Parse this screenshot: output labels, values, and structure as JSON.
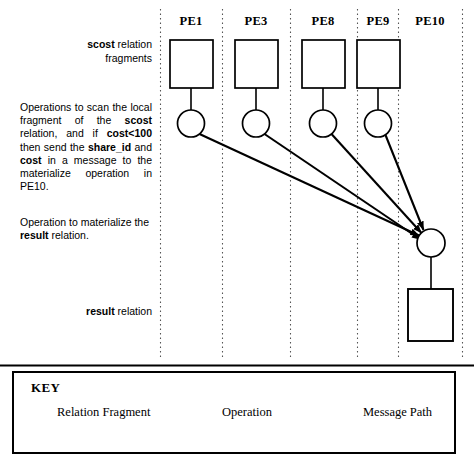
{
  "diagram": {
    "columns": [
      {
        "id": "pe1",
        "label": "PE1",
        "center_x": 191
      },
      {
        "id": "pe3",
        "label": "PE3",
        "center_x": 256
      },
      {
        "id": "pe8",
        "label": "PE8",
        "center_x": 323
      },
      {
        "id": "pe9",
        "label": "PE9",
        "center_x": 378
      },
      {
        "id": "pe10",
        "label": "PE10",
        "center_x": 430
      }
    ],
    "annotations": {
      "scost_fragments": {
        "segments": [
          {
            "text": "scost",
            "bold": true
          },
          {
            "text": " relation",
            "bold": false
          },
          {
            "text": "\nfragments",
            "bold": false
          }
        ]
      },
      "operations_scan": {
        "segments": [
          {
            "text": "Operations to scan the local fragment of the ",
            "bold": false
          },
          {
            "text": "scost",
            "bold": true
          },
          {
            "text": " relation, and if ",
            "bold": false
          },
          {
            "text": "cost<100",
            "bold": true
          },
          {
            "text": " then send the ",
            "bold": false
          },
          {
            "text": "share_id",
            "bold": true
          },
          {
            "text": " and ",
            "bold": false
          },
          {
            "text": "cost",
            "bold": true
          },
          {
            "text": " in a message to the materialize operation in PE10.",
            "bold": false
          }
        ]
      },
      "operation_materialize": {
        "segments": [
          {
            "text": "Operation to materialize the ",
            "bold": false
          },
          {
            "text": "result",
            "bold": true
          },
          {
            "text": " relation.",
            "bold": false
          }
        ]
      },
      "result_relation": {
        "segments": [
          {
            "text": "result",
            "bold": true
          },
          {
            "text": " relation",
            "bold": false
          }
        ]
      }
    },
    "nodes": {
      "fragments": [
        {
          "pe": "PE1",
          "x": 170,
          "y": 40,
          "w": 43,
          "h": 48
        },
        {
          "pe": "PE3",
          "x": 235,
          "y": 40,
          "w": 43,
          "h": 48
        },
        {
          "pe": "PE8",
          "x": 302,
          "y": 40,
          "w": 43,
          "h": 48
        },
        {
          "pe": "PE9",
          "x": 357,
          "y": 40,
          "w": 43,
          "h": 48
        }
      ],
      "operations": [
        {
          "pe": "PE1",
          "cx": 191,
          "cy": 123,
          "r": 13.5
        },
        {
          "pe": "PE3",
          "cx": 256,
          "cy": 123,
          "r": 13.5
        },
        {
          "pe": "PE8",
          "cx": 323,
          "cy": 123,
          "r": 13.5
        },
        {
          "pe": "PE9",
          "cx": 378,
          "cy": 123,
          "r": 13.5
        }
      ],
      "materialize_operation": {
        "pe": "PE10",
        "cx": 431,
        "cy": 243,
        "r": 14
      },
      "result_fragment": {
        "pe": "PE10",
        "x": 408,
        "y": 289,
        "w": 45,
        "h": 52
      }
    },
    "message_paths": [
      {
        "from": "PE1",
        "to": "PE10"
      },
      {
        "from": "PE3",
        "to": "PE10"
      },
      {
        "from": "PE8",
        "to": "PE10"
      },
      {
        "from": "PE9",
        "to": "PE10"
      }
    ],
    "separator_x": [
      160,
      222,
      290,
      357,
      398,
      462
    ],
    "colors": {
      "stroke": "#000000",
      "background": "#ffffff",
      "separator": "#555555"
    }
  },
  "key": {
    "title": "KEY",
    "items": [
      {
        "icon": "square-icon",
        "label": "Relation Fragment"
      },
      {
        "icon": "circle-icon",
        "label": "Operation"
      },
      {
        "icon": "arrow-right-icon",
        "label": "Message Path"
      }
    ]
  }
}
